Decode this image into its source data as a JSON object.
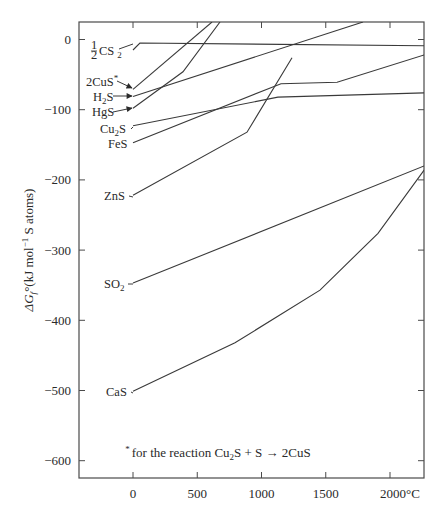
{
  "chart_data": {
    "type": "line",
    "title": "",
    "xlabel": "",
    "x_unit_label": "2000°C",
    "ylabel": "ΔGf°(kJ mol⁻¹ S atoms)",
    "ylabel_parts": {
      "delta_g": "ΔG",
      "sub": "f",
      "deg": "°",
      "rest1": "(kJ mol",
      "sup": "−1",
      "rest2": " S atoms)"
    },
    "xlim": [
      -420,
      2265
    ],
    "ylim": [
      -625,
      25
    ],
    "x_ticks": [
      0,
      500,
      1000,
      1500,
      2000
    ],
    "x_tick_labels": [
      "0",
      "500",
      "1000",
      "1500",
      "2000°C"
    ],
    "y_ticks": [
      0,
      -100,
      -200,
      -300,
      -400,
      -500,
      -600
    ],
    "y_tick_labels": [
      "0",
      "−100",
      "−200",
      "−300",
      "−400",
      "−500",
      "−600"
    ],
    "grid": false,
    "legend": "inline labels at left of each line",
    "series": [
      {
        "name": "½CS₂",
        "label_main": "CS",
        "label_sub": "2",
        "label_frac": "1/2",
        "points": [
          [
            0,
            -15
          ],
          [
            54,
            -5
          ],
          [
            2265,
            -9
          ]
        ]
      },
      {
        "name": "2CuS*",
        "label_main": "2CuS",
        "label_sup": "*",
        "arrow": true,
        "points": [
          [
            0,
            -71
          ],
          [
            615,
            25
          ]
        ]
      },
      {
        "name": "H₂S",
        "label_main": "H",
        "label_sub": "2",
        "label_tail": "S",
        "arrow": true,
        "points": [
          [
            0,
            -81
          ],
          [
            1790,
            25
          ]
        ]
      },
      {
        "name": "HgS",
        "label_main": "HgS",
        "arrow": true,
        "points": [
          [
            0,
            -98
          ],
          [
            389,
            -46
          ],
          [
            677,
            25
          ]
        ]
      },
      {
        "name": "Cu₂S",
        "label_main": "Cu",
        "label_sub": "2",
        "label_tail": "S",
        "points": [
          [
            0,
            -123
          ],
          [
            1128,
            -82
          ],
          [
            2265,
            -76
          ]
        ]
      },
      {
        "name": "FeS",
        "label_main": "FeS",
        "points": [
          [
            0,
            -147
          ],
          [
            1152,
            -63
          ],
          [
            1588,
            -61
          ],
          [
            2265,
            -22
          ]
        ]
      },
      {
        "name": "ZnS",
        "label_main": "ZnS",
        "points": [
          [
            0,
            -222
          ],
          [
            887,
            -132
          ],
          [
            1237,
            -26
          ]
        ]
      },
      {
        "name": "SO₂",
        "label_main": "SO",
        "label_sub": "2",
        "points": [
          [
            0,
            -347
          ],
          [
            2265,
            -180
          ]
        ]
      },
      {
        "name": "CaS",
        "label_main": "CaS",
        "points": [
          [
            0,
            -501
          ],
          [
            794,
            -432
          ],
          [
            1455,
            -357
          ],
          [
            1907,
            -276
          ],
          [
            2265,
            -186
          ]
        ]
      }
    ],
    "annotations": [
      {
        "text": "*for the reaction Cu₂S + S → 2CuS",
        "position": "bottom-right inside plot"
      }
    ]
  },
  "footnote": {
    "star": "*",
    "part1": "for the reaction Cu",
    "sub": "2",
    "part2": "S + S → 2CuS"
  }
}
